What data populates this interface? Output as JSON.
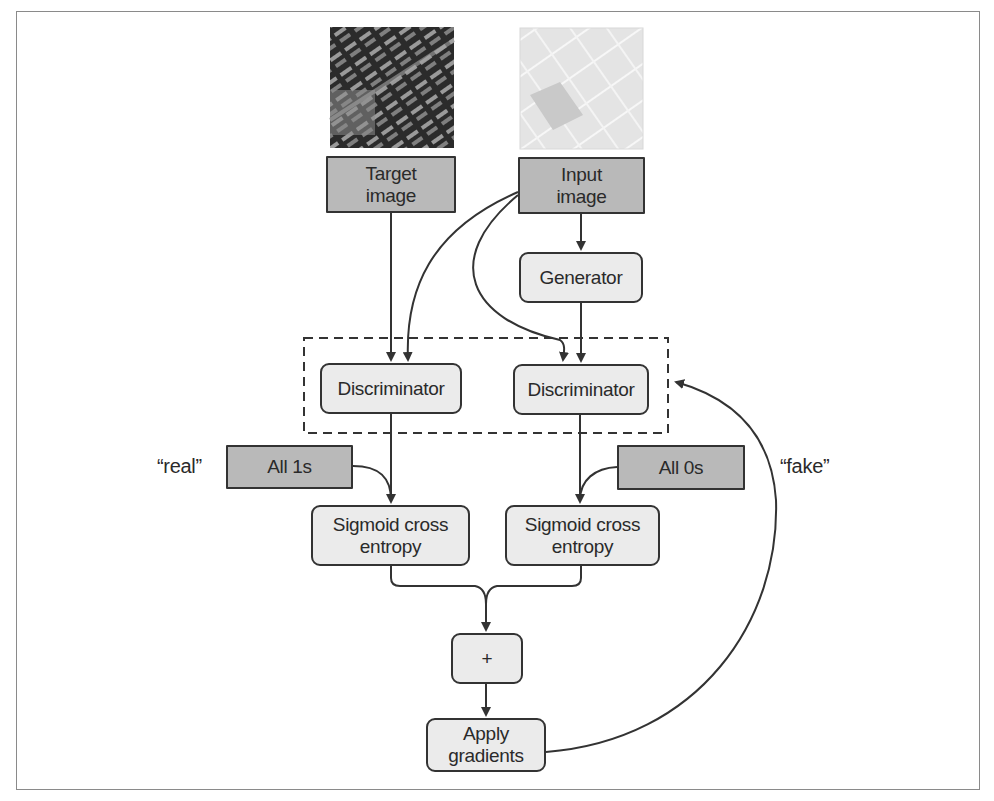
{
  "diagram": {
    "type": "flowchart",
    "title": "",
    "nodes": {
      "target_image": {
        "label": "Target\nimage",
        "style": "dark"
      },
      "input_image": {
        "label": "Input\nimage",
        "style": "dark"
      },
      "generator": {
        "label": "Generator",
        "style": "light"
      },
      "discriminator_real": {
        "label": "Discriminator",
        "style": "light"
      },
      "discriminator_fake": {
        "label": "Discriminator",
        "style": "light"
      },
      "all_ones": {
        "label": "All 1s",
        "style": "dark"
      },
      "all_zeros": {
        "label": "All 0s",
        "style": "dark"
      },
      "sigmoid_real": {
        "label": "Sigmoid cross\nentropy",
        "style": "light"
      },
      "sigmoid_fake": {
        "label": "Sigmoid cross\nentropy",
        "style": "light"
      },
      "sum": {
        "label": "+",
        "style": "light"
      },
      "apply_gradients": {
        "label": "Apply\ngradients",
        "style": "light"
      }
    },
    "annotations": {
      "real": "“real”",
      "fake": "“fake”"
    },
    "images": {
      "target_photo": "aerial-photo-dark",
      "input_photo": "map-tile-light"
    },
    "groups": [
      {
        "name": "discriminator-group",
        "members": [
          "discriminator_real",
          "discriminator_fake"
        ],
        "style": "dashed"
      }
    ],
    "edges": [
      {
        "from": "target_image",
        "to": "discriminator_real"
      },
      {
        "from": "input_image",
        "to": "discriminator_real"
      },
      {
        "from": "input_image",
        "to": "discriminator_fake"
      },
      {
        "from": "input_image",
        "to": "generator"
      },
      {
        "from": "generator",
        "to": "discriminator_fake"
      },
      {
        "from": "discriminator_real",
        "to": "sigmoid_real"
      },
      {
        "from": "all_ones",
        "to": "sigmoid_real"
      },
      {
        "from": "discriminator_fake",
        "to": "sigmoid_fake"
      },
      {
        "from": "all_zeros",
        "to": "sigmoid_fake"
      },
      {
        "from": "sigmoid_real",
        "to": "sum"
      },
      {
        "from": "sigmoid_fake",
        "to": "sum"
      },
      {
        "from": "sum",
        "to": "apply_gradients"
      },
      {
        "from": "apply_gradients",
        "to": "discriminator-group"
      }
    ],
    "colors": {
      "dark_fill": "#b9b9b9",
      "light_fill": "#ebebeb",
      "stroke": "#333333"
    }
  }
}
